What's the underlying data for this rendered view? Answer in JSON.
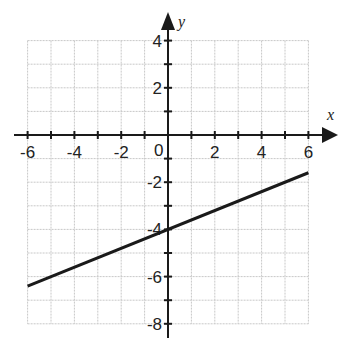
{
  "chart_data": {
    "type": "line",
    "title": "",
    "xlabel": "x",
    "ylabel": "y",
    "xlim": [
      -6,
      6
    ],
    "ylim": [
      -8,
      4
    ],
    "grid": true,
    "grid_step": 1,
    "x_ticks": [
      -6,
      -5,
      -4,
      -3,
      -2,
      -1,
      0,
      1,
      2,
      3,
      4,
      5,
      6
    ],
    "x_tick_labels": [
      "-6",
      "-4",
      "-2",
      "0",
      "2",
      "4",
      "6"
    ],
    "x_tick_label_values": [
      -6,
      -4,
      -2,
      0,
      2,
      4,
      6
    ],
    "y_ticks": [
      -8,
      -7,
      -6,
      -5,
      -4,
      -3,
      -2,
      -1,
      0,
      1,
      2,
      3,
      4
    ],
    "y_tick_labels": [
      "4",
      "2",
      "-2",
      "-4",
      "-6",
      "-8"
    ],
    "y_tick_label_values": [
      4,
      2,
      -2,
      -4,
      -6,
      -8
    ],
    "series": [
      {
        "name": "line",
        "equation": "y = (2/5)x - 4",
        "slope": 0.4,
        "intercept": -4,
        "x": [
          -6,
          6
        ],
        "y": [
          -6.4,
          -1.6
        ]
      }
    ],
    "colors": {
      "axis": "#1a1a1a",
      "grid": "#c8c8c8",
      "line": "#1a1a1a",
      "background": "#ffffff"
    }
  }
}
